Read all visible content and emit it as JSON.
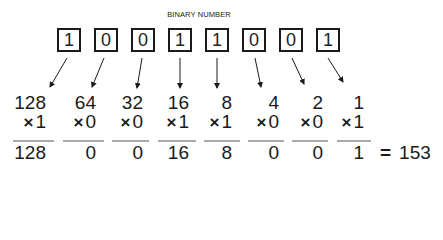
{
  "title": "BINARY NUMBER",
  "bits": [
    "1",
    "0",
    "0",
    "1",
    "1",
    "0",
    "0",
    "1"
  ],
  "multiply_symbol": "×",
  "columns": [
    {
      "place_value": "128",
      "bit": "1",
      "product": "128"
    },
    {
      "place_value": "64",
      "bit": "0",
      "product": "0"
    },
    {
      "place_value": "32",
      "bit": "0",
      "product": "0"
    },
    {
      "place_value": "16",
      "bit": "1",
      "product": "16"
    },
    {
      "place_value": "8",
      "bit": "1",
      "product": "8"
    },
    {
      "place_value": "4",
      "bit": "0",
      "product": "0"
    },
    {
      "place_value": "2",
      "bit": "0",
      "product": "0"
    },
    {
      "place_value": "1",
      "bit": "1",
      "product": "1"
    }
  ],
  "equals_symbol": "=",
  "total": "153"
}
